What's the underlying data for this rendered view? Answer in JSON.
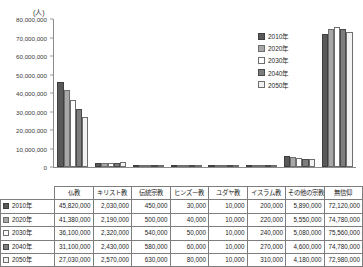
{
  "chart_data": {
    "type": "bar",
    "title": "",
    "unit_label": "(人)",
    "xlabel": "",
    "ylabel": "",
    "ylim": [
      0,
      80000000
    ],
    "ytick_values": [
      0,
      10000000,
      20000000,
      30000000,
      40000000,
      50000000,
      60000000,
      70000000,
      80000000
    ],
    "ytick_labels": [
      "0",
      "10,000,000",
      "20,000,000",
      "30,000,000",
      "40,000,000",
      "50,000,000",
      "60,000,000",
      "70,000,000",
      "80,000,000"
    ],
    "grid": false,
    "legend_position": "top-right",
    "categories": [
      "仏教",
      "キリスト教",
      "伝統宗教",
      "ヒンズー教",
      "ユダヤ教",
      "イスラム教",
      "その他の宗教",
      "無信仰"
    ],
    "series": [
      {
        "name": "2010年",
        "color": "#595959",
        "border": "#3f3f3f",
        "values": [
          45820000,
          2030000,
          450000,
          30000,
          10000,
          200000,
          5890000,
          72120000
        ],
        "labels": [
          "45,820,000",
          "2,030,000",
          "450,000",
          "30,000",
          "10,000",
          "200,000",
          "5,890,000",
          "72,120,000"
        ]
      },
      {
        "name": "2020年",
        "color": "#a8a8a8",
        "border": "#6e6e6e",
        "values": [
          41380000,
          2190000,
          500000,
          40000,
          10000,
          220000,
          5550000,
          74780000
        ],
        "labels": [
          "41,380,000",
          "2,190,000",
          "500,000",
          "40,000",
          "10,000",
          "220,000",
          "5,550,000",
          "74,780,000"
        ]
      },
      {
        "name": "2030年",
        "color": "#ffffff",
        "border": "#6e6e6e",
        "values": [
          36100000,
          2320000,
          540000,
          50000,
          10000,
          240000,
          5080000,
          75560000
        ],
        "labels": [
          "36,100,000",
          "2,320,000",
          "540,000",
          "50,000",
          "10,000",
          "240,000",
          "5,080,000",
          "75,560,000"
        ]
      },
      {
        "name": "2040年",
        "color": "#7d7d7d",
        "border": "#4a4a4a",
        "values": [
          31100000,
          2430000,
          580000,
          60000,
          10000,
          270000,
          4600000,
          74780000
        ],
        "labels": [
          "31,100,000",
          "2,430,000",
          "580,000",
          "60,000",
          "10,000",
          "270,000",
          "4,600,000",
          "74,780,000"
        ]
      },
      {
        "name": "2050年",
        "color": "#f2f2f2",
        "border": "#6e6e6e",
        "values": [
          27030000,
          2570000,
          630000,
          80000,
          10000,
          310000,
          4180000,
          72980000
        ],
        "labels": [
          "27,030,000",
          "2,570,000",
          "630,000",
          "80,000",
          "10,000",
          "310,000",
          "4,180,000",
          "72,980,000"
        ]
      }
    ]
  },
  "legend": {
    "items": [
      {
        "label": "2010年"
      },
      {
        "label": "2020年"
      },
      {
        "label": "2030年"
      },
      {
        "label": "2040年"
      },
      {
        "label": "2050年"
      }
    ]
  }
}
